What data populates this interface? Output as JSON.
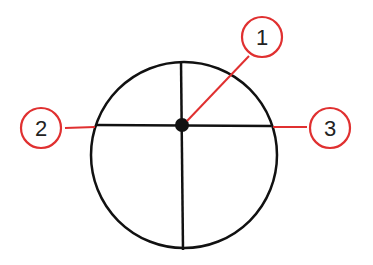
{
  "diagram": {
    "colors": {
      "stroke": "#111111",
      "callout": "#e03030"
    },
    "callouts": [
      {
        "id": "1",
        "label": "1",
        "target": "center point"
      },
      {
        "id": "2",
        "label": "2",
        "target": "left end of horizontal line"
      },
      {
        "id": "3",
        "label": "3",
        "target": "right end of horizontal line"
      }
    ]
  }
}
